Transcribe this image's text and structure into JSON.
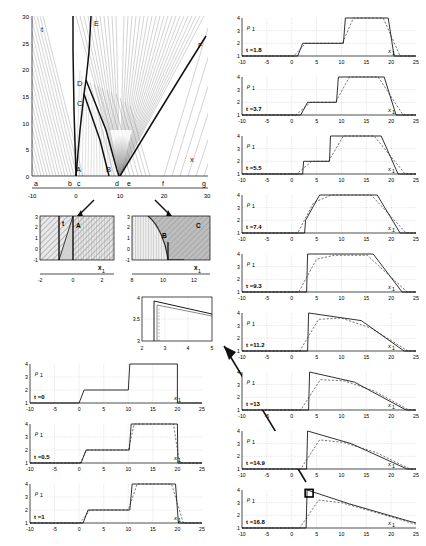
{
  "figure": {
    "type": "scientific-multipanel"
  },
  "main_plot": {
    "name": "characteristics-diagram",
    "xlabel": "x",
    "ylabel": "t",
    "xlim": [
      -10,
      30
    ],
    "ylim": [
      0,
      30
    ],
    "xticks": [
      -10,
      0,
      10,
      20,
      30
    ],
    "yticks": [
      0,
      5,
      10,
      15,
      20,
      25,
      30
    ],
    "region_labels": [
      "A",
      "B",
      "C",
      "D",
      "E",
      "F"
    ],
    "baseline_labels": [
      "a",
      "b",
      "c",
      "d",
      "e",
      "f",
      "g"
    ],
    "baseline_positions": [
      -9.2,
      -1.6,
      0.6,
      9.2,
      12.0,
      20.0,
      29.0
    ],
    "interior_labels": [
      {
        "text": "A",
        "x": 1.3,
        "t": 1.6
      },
      {
        "text": "B",
        "x": 10.6,
        "t": 1.6
      },
      {
        "text": "C",
        "x": 1.6,
        "t": 13.4
      },
      {
        "text": "D",
        "x": 1.6,
        "t": 17.2
      },
      {
        "text": "E",
        "x": 3.4,
        "t": 28.6
      },
      {
        "text": "F",
        "x": 25.5,
        "t": 22.5
      }
    ]
  },
  "inset_left": {
    "name": "inset-region-a",
    "xlabel": "x",
    "ylabel": "t",
    "xlim": [
      -2,
      3
    ],
    "ylim": [
      -1,
      3
    ],
    "xticks": [
      -2,
      0,
      2
    ],
    "yticks": [
      -1,
      0,
      1,
      2,
      3
    ],
    "labels": [
      "A"
    ]
  },
  "inset_right": {
    "name": "inset-region-bc",
    "xlabel": "x",
    "ylabel": "t",
    "xlim": [
      8,
      13
    ],
    "ylim": [
      -1,
      3
    ],
    "xticks": [
      8,
      10,
      12
    ],
    "yticks": [
      -1,
      0,
      1,
      2,
      3
    ],
    "labels": [
      "B",
      "C"
    ]
  },
  "inset_detail": {
    "name": "inset-detail-zoom",
    "xlim": [
      2,
      5
    ],
    "ylim": [
      3,
      4
    ],
    "xticks": [
      2,
      3,
      4,
      5
    ],
    "yticks": [
      3,
      3.5,
      4
    ],
    "ytick_labels": [
      "3",
      "3.5",
      "4"
    ]
  },
  "profiles": {
    "ylabel": "ρ",
    "ylabel_sub": "1",
    "xlabel": "x",
    "xlabel_sub": "1",
    "xlim": [
      -10,
      25
    ],
    "ylim": [
      1,
      4
    ],
    "xticks": [
      -10,
      -5,
      0,
      5,
      10,
      15,
      20,
      25
    ],
    "yticks": [
      1,
      2,
      3,
      4
    ],
    "ytick_labels": [
      "1",
      "2",
      "3",
      "4"
    ],
    "left_column": [
      {
        "label": "t =0",
        "time": 0
      },
      {
        "label": "t =0.5",
        "time": 0.5
      },
      {
        "label": "t =1",
        "time": 1
      }
    ],
    "right_column": [
      {
        "label": "t =1.8",
        "time": 1.8
      },
      {
        "label": "t =3.7",
        "time": 3.7
      },
      {
        "label": "t =5.5",
        "time": 5.5
      },
      {
        "label": "t =7.4",
        "time": 7.4
      },
      {
        "label": "t =9.3",
        "time": 9.3
      },
      {
        "label": "t =11.2",
        "time": 11.2
      },
      {
        "label": "t =13",
        "time": 13
      },
      {
        "label": "t =14.9",
        "time": 14.9
      },
      {
        "label": "t =16.8",
        "time": 16.8
      }
    ]
  },
  "chart_data": {
    "type": "line",
    "title": "",
    "xlabel": "x",
    "ylabel": "ρ₁",
    "xlim": [
      -10,
      25
    ],
    "ylim": [
      1,
      4
    ],
    "grid": true,
    "legend": [
      "exact (solid)",
      "numerical (dashed)"
    ],
    "series": [
      {
        "name": "t=0",
        "solid": [
          [
            -10,
            1
          ],
          [
            0,
            1
          ],
          [
            1,
            2
          ],
          [
            10,
            2
          ],
          [
            10.3,
            4
          ],
          [
            20,
            4
          ],
          [
            20,
            1
          ],
          [
            25,
            1
          ]
        ],
        "dashed": null
      },
      {
        "name": "t=0.5",
        "solid": [
          [
            -10,
            1
          ],
          [
            0.4,
            1
          ],
          [
            1.4,
            2
          ],
          [
            10.2,
            2
          ],
          [
            10.6,
            4
          ],
          [
            20,
            4
          ],
          [
            20.1,
            1
          ],
          [
            25,
            1
          ]
        ],
        "dashed": [
          [
            -10,
            1
          ],
          [
            0.2,
            1
          ],
          [
            1.6,
            2
          ],
          [
            10.0,
            2
          ],
          [
            11.2,
            4
          ],
          [
            19.2,
            4
          ],
          [
            20.4,
            1
          ],
          [
            25,
            1
          ]
        ]
      },
      {
        "name": "t=1",
        "solid": [
          [
            -10,
            1
          ],
          [
            0.8,
            1
          ],
          [
            1.8,
            2
          ],
          [
            10.3,
            2
          ],
          [
            10.8,
            4
          ],
          [
            19.6,
            4
          ],
          [
            20.2,
            1
          ],
          [
            25,
            1
          ]
        ],
        "dashed": [
          [
            -10,
            1
          ],
          [
            0.2,
            1
          ],
          [
            2.2,
            2
          ],
          [
            10.0,
            2
          ],
          [
            11.8,
            4
          ],
          [
            18.8,
            4
          ],
          [
            21.2,
            1
          ],
          [
            25,
            1
          ]
        ]
      },
      {
        "name": "t=1.8",
        "solid": [
          [
            -10,
            1
          ],
          [
            1.2,
            1
          ],
          [
            2.2,
            2
          ],
          [
            10.4,
            2
          ],
          [
            10.8,
            4
          ],
          [
            19.4,
            4
          ],
          [
            20.6,
            1
          ],
          [
            25,
            1
          ]
        ],
        "dashed": [
          [
            -10,
            1
          ],
          [
            0.4,
            1
          ],
          [
            2.8,
            2
          ],
          [
            10.2,
            2
          ],
          [
            12.4,
            4
          ],
          [
            18.4,
            4
          ],
          [
            21.8,
            1
          ],
          [
            25,
            1
          ]
        ]
      },
      {
        "name": "t=3.7",
        "solid": [
          [
            -10,
            1
          ],
          [
            1.8,
            1
          ],
          [
            3.2,
            2
          ],
          [
            9.0,
            2
          ],
          [
            9.4,
            4
          ],
          [
            18.6,
            4
          ],
          [
            21.0,
            1
          ],
          [
            25,
            1
          ]
        ],
        "dashed": [
          [
            -10,
            1
          ],
          [
            0.8,
            1
          ],
          [
            3.8,
            2
          ],
          [
            8.8,
            2
          ],
          [
            11.6,
            4
          ],
          [
            17.4,
            4
          ],
          [
            22.4,
            1
          ],
          [
            25,
            1
          ]
        ]
      },
      {
        "name": "t=5.5",
        "solid": [
          [
            -10,
            1
          ],
          [
            2.2,
            1
          ],
          [
            2.4,
            2
          ],
          [
            7.6,
            2
          ],
          [
            7.8,
            4
          ],
          [
            18.0,
            4
          ],
          [
            21.4,
            1
          ],
          [
            25,
            1
          ]
        ],
        "dashed": [
          [
            -10,
            1
          ],
          [
            1.0,
            1
          ],
          [
            4.0,
            2
          ],
          [
            7.4,
            2
          ],
          [
            10.4,
            4
          ],
          [
            16.6,
            4
          ],
          [
            22.8,
            1
          ],
          [
            25,
            1
          ]
        ]
      },
      {
        "name": "t=7.4",
        "solid": [
          [
            -10,
            1
          ],
          [
            2.6,
            1
          ],
          [
            2.8,
            2
          ],
          [
            5.6,
            4
          ],
          [
            17.2,
            4
          ],
          [
            21.8,
            1
          ],
          [
            25,
            1
          ]
        ],
        "dashed": [
          [
            -10,
            1
          ],
          [
            1.2,
            1
          ],
          [
            4.4,
            3.4
          ],
          [
            8.0,
            4
          ],
          [
            16.0,
            4
          ],
          [
            23.0,
            1
          ],
          [
            25,
            1
          ]
        ]
      },
      {
        "name": "t=9.3",
        "solid": [
          [
            -10,
            1
          ],
          [
            3.0,
            1
          ],
          [
            3.2,
            4
          ],
          [
            16.4,
            4
          ],
          [
            22.2,
            1
          ],
          [
            25,
            1
          ]
        ],
        "dashed": [
          [
            -10,
            1
          ],
          [
            1.4,
            1
          ],
          [
            5.0,
            3.6
          ],
          [
            8.6,
            3.9
          ],
          [
            15.2,
            3.9
          ],
          [
            23.2,
            1
          ],
          [
            25,
            1
          ]
        ]
      },
      {
        "name": "t=11.2",
        "solid": [
          [
            -10,
            1
          ],
          [
            3.2,
            1
          ],
          [
            3.4,
            4
          ],
          [
            14.0,
            3.4
          ],
          [
            22.6,
            1
          ],
          [
            25,
            1
          ]
        ],
        "dashed": [
          [
            -10,
            1
          ],
          [
            1.6,
            1
          ],
          [
            5.4,
            3.5
          ],
          [
            10.0,
            3.6
          ],
          [
            16.0,
            2.8
          ],
          [
            23.4,
            1
          ],
          [
            25,
            1
          ]
        ]
      },
      {
        "name": "t=13",
        "solid": [
          [
            -10,
            1
          ],
          [
            3.4,
            1
          ],
          [
            3.6,
            4
          ],
          [
            12.6,
            3.2
          ],
          [
            23.0,
            1
          ],
          [
            25,
            1
          ]
        ],
        "dashed": [
          [
            -10,
            1
          ],
          [
            1.8,
            1
          ],
          [
            5.8,
            3.4
          ],
          [
            10.6,
            3.3
          ],
          [
            16.6,
            2.5
          ],
          [
            23.6,
            1
          ],
          [
            25,
            1
          ]
        ]
      },
      {
        "name": "t=14.9",
        "solid": [
          [
            -10,
            1
          ],
          [
            3.0,
            1
          ],
          [
            3.2,
            4
          ],
          [
            12.0,
            3.0
          ],
          [
            23.2,
            1
          ],
          [
            25,
            1
          ]
        ],
        "dashed": [
          [
            -10,
            1
          ],
          [
            1.8,
            1
          ],
          [
            5.6,
            3.3
          ],
          [
            10.4,
            3.1
          ],
          [
            17.0,
            2.3
          ],
          [
            23.8,
            1
          ],
          [
            25,
            1
          ]
        ]
      },
      {
        "name": "t=16.8",
        "solid": [
          [
            -10,
            1
          ],
          [
            2.9,
            1
          ],
          [
            3.1,
            4
          ],
          [
            11.6,
            2.9
          ],
          [
            24.0,
            1.5
          ],
          [
            25,
            1.4
          ]
        ],
        "dashed": [
          [
            -10,
            1
          ],
          [
            1.6,
            1
          ],
          [
            5.4,
            3.2
          ],
          [
            10.0,
            3.0
          ],
          [
            17.2,
            2.2
          ],
          [
            24.0,
            1.4
          ],
          [
            25,
            1.3
          ]
        ]
      }
    ]
  },
  "annotations": {
    "highlight_box": {
      "name": "detail-highlight-box",
      "panel": "t =16.8",
      "x_range": [
        2.7,
        4.3
      ],
      "y_range": [
        3.45,
        4.05
      ]
    },
    "arrows": [
      {
        "name": "arrow-to-inset-left",
        "from": "main-plot-region-a",
        "to": "inset-left"
      },
      {
        "name": "arrow-to-inset-right",
        "from": "main-plot-region-bc",
        "to": "inset-right"
      },
      {
        "name": "arrow-to-detail-inset",
        "from": "profile-t-16.8-box",
        "to": "inset-detail"
      }
    ]
  }
}
